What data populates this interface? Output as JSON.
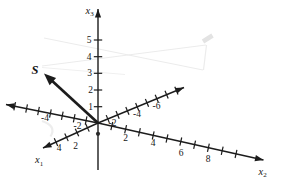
{
  "canvas": {
    "w": 283,
    "h": 182,
    "bg": "#ffffff",
    "ink": "#1c1c1c",
    "text_ink": "#161616",
    "faint": "#ececec"
  },
  "vector_s": {
    "label": "S",
    "from": [
      98,
      123
    ],
    "tip": [
      44,
      73.5
    ],
    "label_x": 31.5,
    "label_y": 74,
    "shaft_w": 2.7,
    "head_l": 12,
    "head_w": 4.8
  },
  "origin_dot": {
    "x": 98,
    "y": 133.8,
    "r": 2.1
  },
  "axes": [
    {
      "id": "x3",
      "label_main": "x",
      "label_sub": "3",
      "label_x": 85.5,
      "label_y": 13.5,
      "from": [
        98,
        170
      ],
      "to": [
        98,
        9
      ],
      "arrow": true,
      "ticks": [
        [
          98,
          106.7
        ],
        [
          98,
          90
        ],
        [
          98,
          73.3
        ],
        [
          98,
          56.7
        ],
        [
          98,
          40
        ]
      ],
      "tick_labels": [
        {
          "t": "1",
          "x": 93,
          "y": 109.5,
          "a": "end"
        },
        {
          "t": "2",
          "x": 93,
          "y": 92.8,
          "a": "end"
        },
        {
          "t": "3",
          "x": 92,
          "y": 76.1,
          "a": "end"
        },
        {
          "t": "4",
          "x": 91.5,
          "y": 59.5,
          "a": "end"
        },
        {
          "t": "5",
          "x": 91.5,
          "y": 42.8,
          "a": "end"
        }
      ]
    },
    {
      "id": "x2",
      "label_main": "x",
      "label_sub": "2",
      "label_x": 258.5,
      "label_y": 174.5,
      "from": [
        98,
        123
      ],
      "to": [
        263.5,
        160
      ],
      "arrow": true,
      "ticks": [
        [
          111.8,
          126.1
        ],
        [
          125.6,
          129.2
        ],
        [
          139.4,
          132.3
        ],
        [
          153.2,
          135.4
        ],
        [
          167,
          138.5
        ],
        [
          180.8,
          141.6
        ],
        [
          194.6,
          144.7
        ],
        [
          208.4,
          147.7
        ],
        [
          222.2,
          150.8
        ],
        [
          236,
          153.9
        ]
      ],
      "tick_labels": [
        {
          "t": "2",
          "x": 125.5,
          "y": 141.2,
          "a": "middle"
        },
        {
          "t": "4",
          "x": 153,
          "y": 146.2,
          "a": "middle"
        },
        {
          "t": "6",
          "x": 181,
          "y": 156.2,
          "a": "middle"
        },
        {
          "t": "8",
          "x": 208,
          "y": 162.2,
          "a": "middle"
        }
      ]
    },
    {
      "id": "x2-negative",
      "from": [
        98,
        123
      ],
      "to": [
        6,
        104.5
      ],
      "arrow": true,
      "ticks": [
        [
          86.1,
          120.6
        ],
        [
          74.2,
          118.2
        ],
        [
          62.3,
          115.8
        ],
        [
          50.4,
          113.4
        ],
        [
          38.5,
          111
        ],
        [
          26.6,
          108.6
        ],
        [
          14.7,
          106.2
        ]
      ],
      "tick_labels": [
        {
          "t": "-2",
          "x": 77.5,
          "y": 128.7,
          "a": "middle"
        },
        {
          "t": "-4",
          "x": 45,
          "y": 121,
          "a": "middle"
        }
      ]
    },
    {
      "id": "x1-negative",
      "from": [
        98,
        123
      ],
      "to": [
        184,
        87.5
      ],
      "arrow": true,
      "ticks": [
        [
          107.8,
          119
        ],
        [
          117.6,
          114.9
        ],
        [
          127.4,
          110.9
        ],
        [
          137.2,
          106.8
        ],
        [
          147,
          102.8
        ],
        [
          156.8,
          98.7
        ],
        [
          166.6,
          94.7
        ],
        [
          176.4,
          90.6
        ]
      ],
      "tick_labels": [
        {
          "t": "-2",
          "x": 112.5,
          "y": 125.8,
          "a": "middle"
        },
        {
          "t": "-4",
          "x": 137,
          "y": 116.5,
          "a": "middle"
        },
        {
          "t": "-6",
          "x": 156.5,
          "y": 108.5,
          "a": "middle"
        }
      ]
    },
    {
      "id": "x1",
      "label_main": "x",
      "label_sub": "1",
      "label_x": 35,
      "label_y": 163,
      "from": [
        98,
        123
      ],
      "to": [
        43,
        148
      ],
      "arrow": true,
      "ticks": [
        [
          87.5,
          127.8
        ],
        [
          77,
          132.5
        ],
        [
          66.5,
          137.3
        ],
        [
          56,
          142.1
        ]
      ],
      "tick_labels": [
        {
          "t": "2",
          "x": 75.5,
          "y": 148.7,
          "a": "middle"
        },
        {
          "t": "4",
          "x": 59,
          "y": 151.2,
          "a": "middle"
        }
      ]
    }
  ],
  "bleed_through": {
    "lines": [
      {
        "from": [
          44,
          38
        ],
        "to": [
          203,
          70
        ],
        "w": 1.2,
        "c": "#ececec"
      },
      {
        "from": [
          42,
          66
        ],
        "to": [
          206,
          45
        ],
        "w": 1.2,
        "c": "#ececec"
      },
      {
        "from": [
          42,
          67.5
        ],
        "to": [
          125,
          74.5
        ],
        "w": 1.2,
        "c": "#f0f0f0"
      },
      {
        "from": [
          206.5,
          45
        ],
        "to": [
          203.5,
          70
        ],
        "w": 1.2,
        "c": "#ececec"
      },
      {
        "from": [
          203,
          41.5
        ],
        "to": [
          212.5,
          35.5
        ],
        "w": 4.5,
        "c": "#e3e3e3"
      }
    ],
    "curve": {
      "d": "M 42 121 Q 57 126 50.5 136.5",
      "w": 2.2,
      "c": "#ededed"
    }
  },
  "style": {
    "axis_w": 1.4,
    "tick_half": 4.2,
    "tick_w": 1.2,
    "head_l": 8.5,
    "head_w": 3.1
  }
}
